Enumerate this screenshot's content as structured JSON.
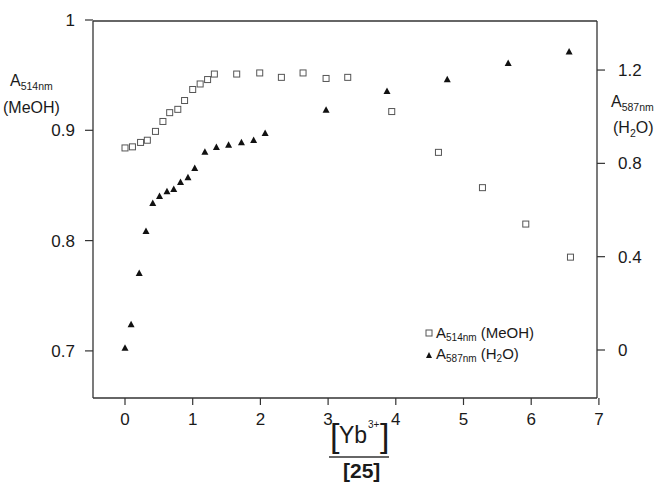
{
  "chart_data": {
    "type": "scatter",
    "title": "",
    "xlabel": {
      "numerator": "[Yb3+]",
      "numerator_base": "Yb",
      "numerator_sup": "3+",
      "denominator": "[25]",
      "denominator_text": "25"
    },
    "ylabel_left": {
      "main": "A",
      "sub": "514nm",
      "line2": "(MeOH)"
    },
    "ylabel_right": {
      "main": "A",
      "sub": "587nm",
      "line2_pre": "(H",
      "line2_sub": "2",
      "line2_post": "O)"
    },
    "xlim": [
      -0.45,
      7
    ],
    "ylim_left": [
      0.66,
      1.0
    ],
    "ylim_right": [
      -0.17,
      1.39
    ],
    "x_ticks": [
      0,
      1,
      2,
      3,
      4,
      5,
      6,
      7
    ],
    "x_tick_labels": [
      "0",
      "1",
      "2",
      "3",
      "4",
      "5",
      "6",
      "7"
    ],
    "y_left_ticks": [
      0.7,
      0.8,
      0.9,
      1.0
    ],
    "y_left_tick_labels": [
      "0.7",
      "0.8",
      "0.9",
      "1"
    ],
    "y_right_ticks": [
      0,
      0.4,
      0.8,
      1.2
    ],
    "y_right_tick_labels": [
      "0",
      "0.4",
      "0.8",
      "1.2"
    ],
    "grid": false,
    "legend_position": "lower right (inside)",
    "series": [
      {
        "name": "A514nm (MeOH)",
        "marker": "open-square",
        "axis": "left",
        "x": [
          0.0,
          0.11,
          0.23,
          0.33,
          0.45,
          0.56,
          0.66,
          0.78,
          0.88,
          1.0,
          1.11,
          1.22,
          1.32,
          1.65,
          1.99,
          2.31,
          2.63,
          2.97,
          3.29,
          3.94,
          4.63,
          5.28,
          5.92,
          6.58
        ],
        "y": [
          0.884,
          0.885,
          0.889,
          0.891,
          0.899,
          0.908,
          0.916,
          0.919,
          0.927,
          0.937,
          0.942,
          0.946,
          0.951,
          0.951,
          0.952,
          0.948,
          0.952,
          0.947,
          0.948,
          0.917,
          0.88,
          0.848,
          0.815,
          0.785
        ]
      },
      {
        "name": "A587nm (H2O)",
        "marker": "filled-triangle",
        "axis": "right",
        "x": [
          0.0,
          0.09,
          0.21,
          0.31,
          0.41,
          0.51,
          0.62,
          0.72,
          0.82,
          0.93,
          1.03,
          1.18,
          1.35,
          1.53,
          1.72,
          1.9,
          2.07,
          2.97,
          3.87,
          4.76,
          5.66,
          6.56
        ],
        "y": [
          0.01,
          0.11,
          0.33,
          0.51,
          0.63,
          0.66,
          0.68,
          0.69,
          0.72,
          0.74,
          0.78,
          0.85,
          0.87,
          0.88,
          0.89,
          0.9,
          0.93,
          1.03,
          1.11,
          1.16,
          1.23,
          1.28
        ]
      }
    ],
    "legend": [
      {
        "marker": "open-square",
        "main": "A",
        "sub": "514nm",
        "suffix": " (MeOH)"
      },
      {
        "marker": "filled-triangle",
        "main": "A",
        "sub": "587nm",
        "suffix_pre": " (H",
        "suffix_sub": "2",
        "suffix_post": "O)"
      }
    ]
  }
}
